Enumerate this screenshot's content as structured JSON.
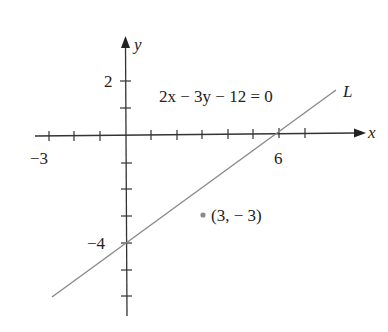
{
  "figure": {
    "equation": "2x − 3y − 12 = 0",
    "line_label": "L",
    "x_axis_label": "x",
    "y_axis_label": "y",
    "x_tick_labels": [
      {
        "value": -3,
        "text": "−3"
      },
      {
        "value": 6,
        "text": "6"
      }
    ],
    "y_tick_labels": [
      {
        "value": 2,
        "text": "2"
      },
      {
        "value": -4,
        "text": "−4"
      }
    ],
    "point": {
      "x": 3,
      "y": -3,
      "label": "(3, − 3)"
    },
    "x_ticks": [
      -3,
      -2,
      -1,
      1,
      2,
      3,
      4,
      5,
      6,
      7
    ],
    "y_ticks": [
      2,
      1,
      -1,
      -2,
      -3,
      -4,
      -5,
      -6
    ],
    "colors": {
      "axis": "#333333",
      "line": "#8a8a8a",
      "point": "#8a8a8a",
      "text": "#222222"
    }
  }
}
